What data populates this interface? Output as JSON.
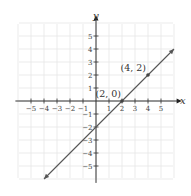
{
  "chart_data": {
    "type": "line",
    "title": "",
    "xlabel": "x",
    "ylabel": "y",
    "xlim": [
      -6,
      6
    ],
    "ylim": [
      -6,
      6
    ],
    "grid": true,
    "x_ticks": [
      -5,
      -4,
      -3,
      -2,
      -1,
      1,
      2,
      3,
      4,
      5
    ],
    "y_ticks": [
      5,
      4,
      3,
      2,
      1,
      -1,
      -2,
      -3,
      -4,
      -5
    ],
    "x_tick_labels": [
      "−5",
      "−4",
      "−3",
      "−2",
      "−1",
      "1",
      "2",
      "3",
      "4",
      "5"
    ],
    "y_tick_labels": [
      "5",
      "4",
      "3",
      "2",
      "1",
      "−1",
      "−2",
      "−3",
      "−4",
      "−5"
    ],
    "series": [
      {
        "name": "y = x - 2",
        "x": [
          -4,
          6
        ],
        "y": [
          -6,
          4
        ],
        "arrows": "both",
        "color": "#555555"
      }
    ],
    "points": [
      {
        "x": 2,
        "y": 0,
        "label": "(2, 0)"
      },
      {
        "x": 4,
        "y": 2,
        "label": "(4, 2)"
      }
    ]
  }
}
